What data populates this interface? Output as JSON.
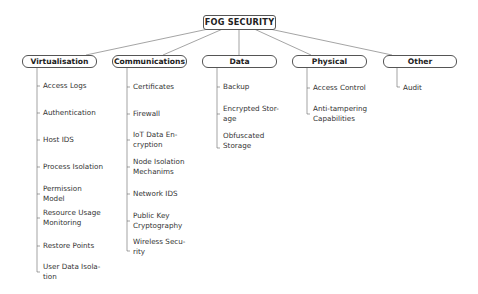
{
  "root": {
    "label": "FOG SECURITY"
  },
  "categories": [
    {
      "label": "Virtualisation",
      "items": [
        "Access Logs",
        "Authentication",
        "Host IDS",
        "Process Isolation",
        "Permission\nModel",
        "Resource Usage\nMonitoring",
        "Restore Points",
        "User Data Isola-\ntion"
      ]
    },
    {
      "label": "Communications",
      "items": [
        "Certificates",
        "Firewall",
        "IoT Data En-\ncryption",
        "Node Isolation\nMechanims",
        "Network IDS",
        "Public Key\nCryptography",
        "Wireless Secu-\nrity"
      ]
    },
    {
      "label": "Data",
      "items": [
        "Backup",
        "Encrypted Stor-\nage",
        "Obfuscated\nStorage"
      ]
    },
    {
      "label": "Physical",
      "items": [
        "Access Control",
        "Anti-tampering\nCapabilities"
      ]
    },
    {
      "label": "Other",
      "items": [
        "Audit"
      ]
    }
  ]
}
